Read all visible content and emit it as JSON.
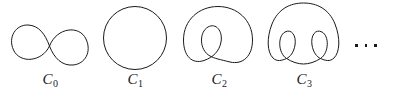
{
  "figure": {
    "background_color": "#ffffff",
    "stroke_color": "#1a1a1a",
    "width": 394,
    "height": 98,
    "curves": [
      {
        "id": "c0",
        "label_base": "C",
        "label_sub": "0",
        "label_text": "C0",
        "shape": "figure-eight",
        "inner_loops": 0,
        "description": "lemniscate: two lobes crossing at the center",
        "panel_left": 6,
        "panel_width": 88,
        "label_top": 72
      },
      {
        "id": "c1",
        "label_base": "C",
        "label_sub": "1",
        "label_text": "C1",
        "shape": "circle",
        "inner_loops": 0,
        "description": "simple closed circle",
        "panel_left": 96,
        "panel_width": 78,
        "label_top": 72
      },
      {
        "id": "c2",
        "label_base": "C",
        "label_sub": "2",
        "label_text": "C2",
        "shape": "limacon-one-loop",
        "inner_loops": 1,
        "description": "circle with one inner loop hanging from the top",
        "panel_left": 180,
        "panel_width": 78,
        "label_top": 72
      },
      {
        "id": "c3",
        "label_base": "C",
        "label_sub": "3",
        "label_text": "C3",
        "shape": "limacon-two-loops",
        "inner_loops": 2,
        "description": "circle with two inner loops side by side",
        "panel_left": 264,
        "panel_width": 80,
        "label_top": 72
      }
    ],
    "ellipsis": {
      "text": "...",
      "dot_count": 3,
      "left": 355,
      "top": 44
    }
  }
}
